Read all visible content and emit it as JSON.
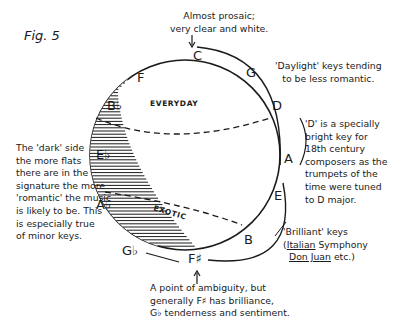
{
  "figure": {
    "label": "Fig. 5"
  },
  "keys": {
    "C": "C",
    "G": "G",
    "D": "D",
    "A": "A",
    "E": "E",
    "B": "B",
    "F_sharp": "F♯",
    "G_flat": "G♭",
    "A_flat": "A♭",
    "E_flat": "E♭",
    "B_flat": "B♭",
    "F": "F"
  },
  "regions": {
    "everyday": "EVERYDAY",
    "exotic": "EXOTIC"
  },
  "annotations": {
    "c_note": {
      "line1": "Almost prosaic;",
      "line2": "very clear and white."
    },
    "daylight": {
      "line1": "'Daylight' keys tending",
      "line2": "to be less romantic."
    },
    "d_note": {
      "line1": "'D' is a specially",
      "line2": "bright key for",
      "line3": "18th century",
      "line4": "composers as the",
      "line5": "trumpets of the",
      "line6": "time were tuned",
      "line7": "to D major."
    },
    "dark_side": {
      "line1": "The 'dark' side",
      "line2": "the more flats",
      "line3": "there are in the",
      "line4": "signature the more",
      "line5": "'romantic' the music",
      "line6": "is likely to be. This",
      "line7": "is especially true",
      "line8": "of minor keys."
    },
    "brilliant": {
      "line1": "'Brilliant' keys",
      "paren_open": "(",
      "italian": "Italian",
      "symphony": " Symphony",
      "don_juan": "Don Juan",
      "etc": " etc.)"
    },
    "ambiguity": {
      "line1": "A point of ambiguity, but",
      "line2": "generally F♯ has brilliance,",
      "line3": "G♭ tenderness and sentiment."
    }
  },
  "colors": {
    "ink": "#1a1a1a",
    "paper": "#ffffff"
  }
}
